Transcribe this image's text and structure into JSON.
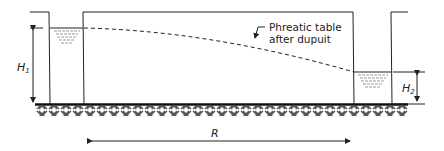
{
  "diagram": {
    "annotation": {
      "line1": "Phreatic table",
      "line2": "after dupuit"
    },
    "labels": {
      "H1": "H",
      "H1_sub": "1",
      "H2": "H",
      "H2_sub": "2",
      "R": "R"
    },
    "colors": {
      "line": "#222222",
      "water": "#999999",
      "ground_hatch": "#555555"
    }
  }
}
